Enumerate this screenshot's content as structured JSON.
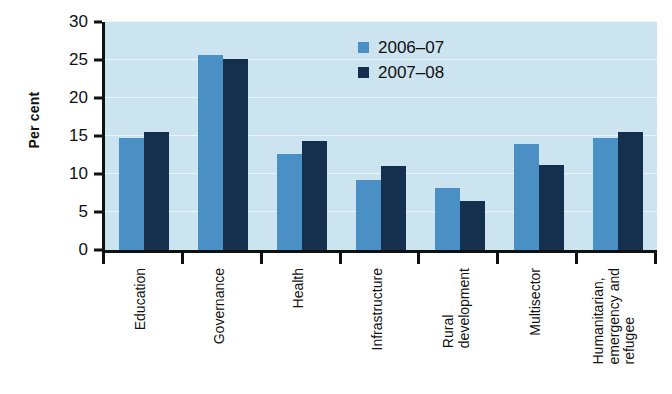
{
  "chart_data": {
    "type": "bar",
    "title": "",
    "xlabel": "",
    "ylabel": "Per cent",
    "ylim": [
      0,
      30
    ],
    "yticks": [
      0,
      5,
      10,
      15,
      20,
      25,
      30
    ],
    "grid": true,
    "legend_position": "top-center",
    "categories": [
      "Education",
      "Governance",
      "Health",
      "Infrastructure",
      "Rural development",
      "Multisector",
      "Humanitarian, emergency and refugee"
    ],
    "category_lines": [
      [
        "Education"
      ],
      [
        "Governance"
      ],
      [
        "Health"
      ],
      [
        "Infrastructure"
      ],
      [
        "Rural",
        "development"
      ],
      [
        "Multisector"
      ],
      [
        "Humanitarian,",
        "emergency and",
        "refugee"
      ]
    ],
    "series": [
      {
        "name": "2006–07",
        "color": "#4a90c4",
        "values": [
          14.7,
          25.6,
          12.6,
          9.2,
          8.2,
          13.9,
          14.8
        ]
      },
      {
        "name": "2007–08",
        "color": "#15304f",
        "values": [
          15.5,
          25.1,
          14.4,
          11.1,
          6.4,
          11.2,
          15.5
        ]
      }
    ],
    "colors": {
      "plot_background": "#cce3f0",
      "gridline": "#eaf4fb",
      "axis": "#111111",
      "series_0": "#4a90c4",
      "series_1": "#15304f"
    }
  }
}
